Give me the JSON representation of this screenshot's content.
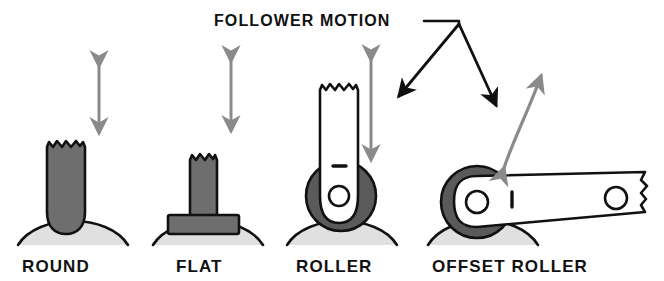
{
  "diagram": {
    "title": "FOLLOWER MOTION",
    "colors": {
      "background": "#ffffff",
      "ink": "#111111",
      "follower_body": "#6e6e6e",
      "roller_wheel": "#5a5a5a",
      "cam_surface": "#e0e0e0",
      "motion_arrow": "#8a8a8a",
      "leader_arrow": "#111111",
      "arm_fill": "#ffffff"
    },
    "callout": {
      "label": "FOLLOWER MOTION",
      "arrow_targets": [
        "roller",
        "offset-roller"
      ],
      "arrow_count": 2
    },
    "figures": [
      {
        "id": "round",
        "label": "ROUND",
        "follower_shape": "rod-with-rounded-tip",
        "motion": "linear-vertical",
        "motion_arrow": "double-headed-straight",
        "has_roller_wheel": false,
        "top_edge": "broken-jagged"
      },
      {
        "id": "flat",
        "label": "FLAT",
        "follower_shape": "tee-stem-with-flat-plate",
        "motion": "linear-vertical",
        "motion_arrow": "double-headed-straight",
        "has_roller_wheel": false,
        "top_edge": "broken-jagged"
      },
      {
        "id": "roller",
        "label": "ROLLER",
        "follower_shape": "arm-with-rounded-end-and-pivot",
        "motion": "linear-vertical",
        "motion_arrow": "double-headed-straight",
        "has_roller_wheel": true,
        "top_edge": "broken-jagged",
        "pivot_holes": 1,
        "tick_mark": true
      },
      {
        "id": "offset-roller",
        "label": "OFFSET ROLLER",
        "follower_shape": "horizontal-lever-arm",
        "motion": "oscillating-swing",
        "motion_arrow": "double-headed-curved",
        "has_roller_wheel": true,
        "right_edge": "broken-jagged",
        "pivot_holes": 2,
        "tick_mark": true
      }
    ]
  }
}
